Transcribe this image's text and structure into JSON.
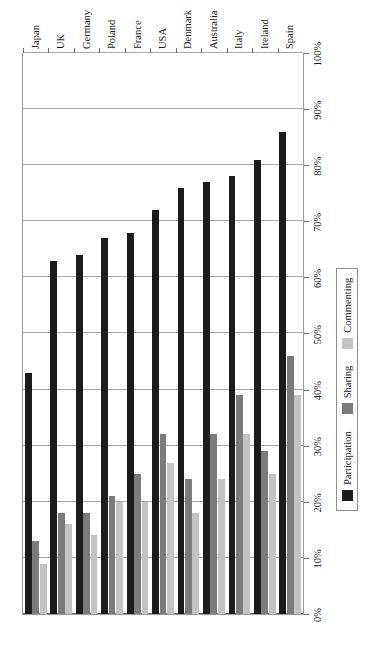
{
  "chart_data": {
    "type": "bar",
    "orientation": "horizontal-rotated",
    "title": "",
    "xlabel": "",
    "ylabel": "",
    "categories": [
      "Spain",
      "Ireland",
      "Italy",
      "Australia",
      "Denmark",
      "USA",
      "France",
      "Poland",
      "Germany",
      "UK",
      "Japan"
    ],
    "series": [
      {
        "name": "Participation",
        "color": "#1c1c1c",
        "values": [
          86,
          81,
          78,
          77,
          76,
          72,
          68,
          67,
          64,
          63,
          43
        ]
      },
      {
        "name": "Sharing",
        "color": "#7b7b7b",
        "values": [
          46,
          29,
          39,
          32,
          24,
          32,
          25,
          21,
          18,
          18,
          13
        ]
      },
      {
        "name": "Commenting",
        "color": "#c3c3c3",
        "values": [
          39,
          25,
          32,
          24,
          18,
          27,
          20,
          20,
          14,
          16,
          9
        ]
      }
    ],
    "value_ticks": [
      "0%",
      "10%",
      "20%",
      "30%",
      "40%",
      "50%",
      "60%",
      "70%",
      "80%",
      "90%",
      "100%"
    ],
    "value_tick_numbers": [
      0,
      10,
      20,
      30,
      40,
      50,
      60,
      70,
      80,
      90,
      100
    ],
    "xlim": [
      0,
      100
    ],
    "grid": true,
    "legend_position": "bottom-left",
    "legend": [
      "Participation",
      "Sharing",
      "Commenting"
    ]
  },
  "axis": {
    "tick_labels": [
      "0%",
      "10%",
      "20%",
      "30%",
      "40%",
      "50%",
      "60%",
      "70%",
      "80%",
      "90%",
      "100%"
    ]
  },
  "legend": {
    "items": [
      {
        "label": "Participation",
        "color": "#1c1c1c"
      },
      {
        "label": "Sharing",
        "color": "#7b7b7b"
      },
      {
        "label": "Commenting",
        "color": "#c3c3c3"
      }
    ]
  },
  "caption": {
    "text": ""
  }
}
